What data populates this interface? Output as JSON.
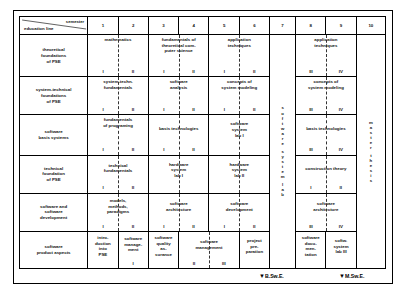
{
  "diagram": {
    "corner": {
      "semester_label": "semester",
      "education_line_label": "education line"
    },
    "semesters": [
      "1",
      "2",
      "3",
      "4",
      "5",
      "6",
      "7",
      "8",
      "9",
      "10"
    ],
    "education_lines": [
      "theoretical foundations of PSE",
      "system-technical foundations of PSE",
      "software basis systems",
      "technical foundation of PSE",
      "software and software development",
      "software product aspects"
    ],
    "education_lines_wrapped": [
      [
        "theoretical",
        "foundations",
        "of PSE"
      ],
      [
        "system-technical",
        "foundations",
        "of PSE"
      ],
      [
        "software",
        "basis systems"
      ],
      [
        "technical",
        "foundation",
        "of PSE"
      ],
      [
        "software and",
        "software",
        "development"
      ],
      [
        "software",
        "product aspects"
      ]
    ],
    "vertical_columns": {
      "col7": "software system lab",
      "col7_letters": [
        "s",
        "o",
        "f",
        "t",
        "w",
        "a",
        "r",
        "e",
        "",
        "s",
        "y",
        "s",
        "t",
        "e",
        "m",
        "",
        "l",
        "a",
        "b"
      ],
      "col10": "master thesis",
      "col10_letters": [
        "m",
        "a",
        "s",
        "t",
        "e",
        "r",
        "",
        "t",
        "h",
        "e",
        "s",
        "i",
        "s"
      ]
    },
    "markers": [
      {
        "name": "bachelor",
        "label": "B.Sw.E.",
        "arrow": "▼"
      },
      {
        "name": "master",
        "label": "M.Sw.E.",
        "arrow": "▼"
      }
    ],
    "rows": [
      {
        "line": "theoretical foundations of PSE",
        "cells": [
          {
            "span": "1-2",
            "title": [
              "mathematics"
            ],
            "nums": [
              "I",
              "II"
            ]
          },
          {
            "span": "3-4",
            "title": [
              "fundamentals of",
              "theoretical com-",
              "puter science"
            ],
            "nums": [
              "I",
              "II"
            ]
          },
          {
            "span": "5-6",
            "title": [
              "application",
              "techniques"
            ],
            "nums": [
              "I",
              "II"
            ]
          },
          {
            "span": "8-9",
            "title": [
              "application",
              "techniques"
            ],
            "nums": [
              "III",
              "IV"
            ]
          }
        ]
      },
      {
        "line": "system-technical foundations of PSE",
        "cells": [
          {
            "span": "1-2",
            "title": [
              "system-techn.",
              "fundamentals"
            ],
            "nums": [
              "I",
              "II"
            ]
          },
          {
            "span": "3-4",
            "title": [
              "software",
              "analysis"
            ],
            "nums": [
              "I",
              "II"
            ]
          },
          {
            "span": "5-6",
            "title": [
              "concepts of",
              "system modeling"
            ],
            "nums": [
              "I",
              "II"
            ]
          },
          {
            "span": "8-9",
            "title": [
              "concepts of",
              "system modeling"
            ],
            "nums": [
              "III",
              "IV"
            ]
          }
        ]
      },
      {
        "line": "software basis systems",
        "cells": [
          {
            "span": "1-2",
            "title": [
              "fundamentals",
              "of programing"
            ],
            "nums": [
              "I",
              "II"
            ]
          },
          {
            "span": "3-4",
            "title": [
              "basis technologies"
            ],
            "nums": [
              "I",
              "II"
            ]
          },
          {
            "span": "5-6",
            "title": [
              "software",
              "system",
              "lab I"
            ],
            "nums": []
          },
          {
            "span": "8-9",
            "title": [
              "basis technologies"
            ],
            "nums": [
              "III",
              "IV"
            ]
          }
        ]
      },
      {
        "line": "technical foundation of PSE",
        "cells": [
          {
            "span": "1-2",
            "title": [
              "technical",
              "fundamentals"
            ],
            "nums": [
              "I",
              "II"
            ]
          },
          {
            "span": "3-4",
            "title": [
              "hardware",
              "system",
              "lab I"
            ],
            "nums": []
          },
          {
            "span": "5-6",
            "title": [
              "hardware",
              "system",
              "lab II"
            ],
            "nums": []
          },
          {
            "span": "8-9",
            "title": [
              "construction theory"
            ],
            "nums": [
              "I",
              "II"
            ]
          }
        ]
      },
      {
        "line": "software and software development",
        "cells": [
          {
            "span": "1-2",
            "title": [
              "models,",
              "methods,",
              "paradigms"
            ],
            "nums": [
              "I",
              "II"
            ]
          },
          {
            "span": "3-4",
            "title": [
              "software",
              "architecture"
            ],
            "nums": [
              "I",
              "II"
            ]
          },
          {
            "span": "5-6",
            "title": [
              "software",
              "development"
            ],
            "nums": [
              "I",
              "II"
            ]
          },
          {
            "span": "8-9",
            "title": [
              "software",
              "architecture"
            ],
            "nums": [
              "III",
              "IV"
            ]
          }
        ]
      },
      {
        "line": "software product aspects",
        "cells": [
          {
            "span": "1",
            "title": [
              "intro-",
              "duction",
              "into",
              "PSE"
            ],
            "nums": []
          },
          {
            "span": "2",
            "title": [
              "software",
              "manage-",
              "ment"
            ],
            "nums": [
              "I"
            ]
          },
          {
            "span": "3",
            "title": [
              "software",
              "quality",
              "as-",
              "surance"
            ],
            "nums": []
          },
          {
            "span": "4-5",
            "title": [
              "software",
              "management"
            ],
            "nums": [
              "II",
              "III"
            ]
          },
          {
            "span": "6",
            "title": [
              "project",
              "pre-",
              "paration"
            ],
            "nums": []
          },
          {
            "span": "8",
            "title": [
              "software",
              "docu-",
              "men-",
              "tation"
            ],
            "nums": []
          },
          {
            "span": "9",
            "title": [
              "softw.",
              "system",
              "lab III"
            ],
            "nums": []
          }
        ]
      }
    ]
  }
}
